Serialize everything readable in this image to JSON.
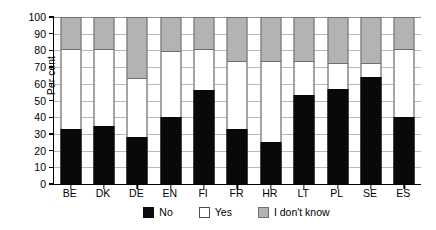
{
  "chart_data": {
    "type": "bar",
    "stacked": true,
    "title": "",
    "xlabel": "",
    "ylabel": "Per cent",
    "ylim": [
      0,
      100
    ],
    "ytick_step": 10,
    "yticks": [
      0,
      10,
      20,
      30,
      40,
      50,
      60,
      70,
      80,
      90,
      100
    ],
    "grid": true,
    "legend_position": "bottom-center",
    "categories": [
      "BE",
      "DK",
      "DE",
      "EN",
      "FI",
      "FR",
      "HR",
      "LT",
      "PL",
      "SE",
      "ES"
    ],
    "series": [
      {
        "name": "No",
        "color": "#0d0d0d",
        "values": [
          33,
          35,
          28,
          40,
          56,
          33,
          25,
          53,
          57,
          64,
          40
        ]
      },
      {
        "name": "Yes",
        "color": "#ffffff",
        "values": [
          47,
          45,
          35,
          39,
          24,
          40,
          48,
          20,
          15,
          8,
          40
        ]
      },
      {
        "name": "I don't know",
        "color": "#b3b3b3",
        "values": [
          20,
          20,
          37,
          21,
          20,
          27,
          27,
          27,
          28,
          28,
          20
        ]
      }
    ]
  },
  "axis": {
    "y_title": "Per cent",
    "y_labels": [
      "100",
      "90",
      "80",
      "70",
      "60",
      "50",
      "40",
      "30",
      "20",
      "10",
      "0"
    ]
  },
  "legend": {
    "items": [
      {
        "label": "No",
        "swatch": "black-square-icon"
      },
      {
        "label": "Yes",
        "swatch": "white-square-icon"
      },
      {
        "label": "I don't know",
        "swatch": "gray-square-icon"
      }
    ]
  }
}
